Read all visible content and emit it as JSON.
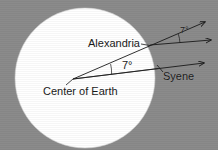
{
  "figure": {
    "type": "geometry-diagram",
    "background_color": "#8b8b8b",
    "earth_fill_color": "#ffffff",
    "line_color": "#1a1a1a"
  },
  "labels": {
    "alexandria": "Alexandria",
    "syene": "Syene",
    "center_of_earth": "Center of Earth",
    "angle_at_center": "7°",
    "angle_at_alexandria": "7°"
  },
  "geometry": {
    "earth_circle": {
      "cx": 85,
      "cy": 78,
      "r": 70
    },
    "center_point": {
      "x": 73,
      "y": 79
    },
    "alexandria_point": {
      "x": 150,
      "y": 45
    },
    "syene_point": {
      "x": 157,
      "y": 68
    },
    "rays": [
      {
        "name": "center-to-alexandria-extended",
        "from_x": 73,
        "from_y": 79,
        "to_x": 205,
        "to_y": 22
      },
      {
        "name": "sun-ray-through-alexandria",
        "from_x": 150,
        "from_y": 45,
        "to_x": 212,
        "to_y": 40
      },
      {
        "name": "center-to-syene-extended",
        "from_x": 73,
        "from_y": 79,
        "to_x": 206,
        "to_y": 63
      },
      {
        "name": "horizontal-from-center",
        "from_x": 73,
        "from_y": 79,
        "to_x": 160,
        "to_y": 79
      }
    ],
    "angle_arcs": [
      {
        "name": "arc-at-center",
        "cx": 73,
        "cy": 79,
        "r": 38
      },
      {
        "name": "arc-at-alexandria",
        "cx": 150,
        "cy": 45,
        "r": 30
      }
    ]
  }
}
